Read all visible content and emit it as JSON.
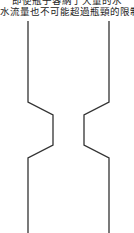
{
  "caption": {
    "line1": "即使瓶子容納了大量的水",
    "line2": "水流量也不可能超過瓶頸的限制"
  },
  "diagram": {
    "stroke_color": "#333333",
    "background": "#ffffff"
  }
}
